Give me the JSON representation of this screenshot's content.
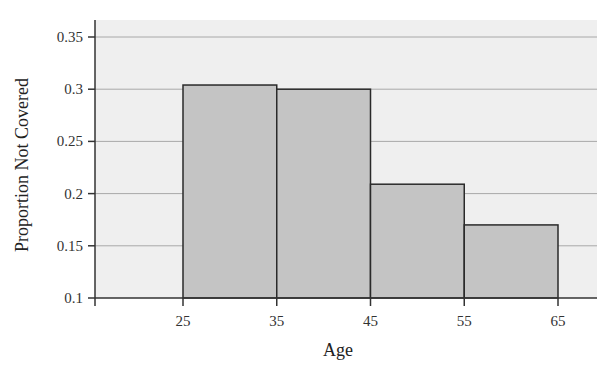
{
  "chart_data": {
    "type": "bar",
    "subtype": "histogram",
    "title": "",
    "xlabel": "Age",
    "ylabel": "Proportion Not Covered",
    "bins": [
      {
        "from": 25,
        "to": 35,
        "value": 0.304
      },
      {
        "from": 35,
        "to": 45,
        "value": 0.3
      },
      {
        "from": 45,
        "to": 55,
        "value": 0.209
      },
      {
        "from": 55,
        "to": 65,
        "value": 0.17
      }
    ],
    "categories": [
      "25-35",
      "35-45",
      "45-55",
      "55-65"
    ],
    "values": [
      0.304,
      0.3,
      0.209,
      0.17
    ],
    "x_ticks": [
      25,
      35,
      45,
      55,
      65
    ],
    "y_ticks": [
      "0.1",
      "0.15",
      "0.2",
      "0.25",
      "0.3",
      "0.35"
    ],
    "ylim": [
      0.1,
      0.36
    ],
    "xlim": [
      11,
      68
    ],
    "grid": true,
    "legend": null,
    "colors": {
      "bar_fill": "#c4c4c4",
      "bar_edge": "#2a2a2a",
      "plot_bg": "#efefef",
      "grid": "#a8a8a8",
      "axis": "#333333"
    }
  }
}
